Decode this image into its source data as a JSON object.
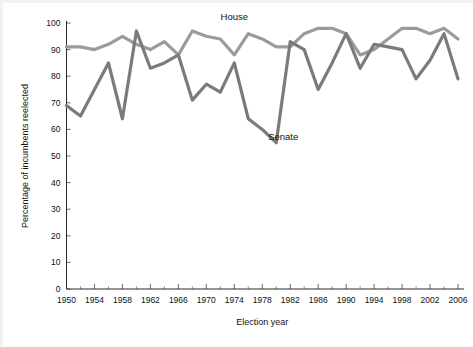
{
  "chart_data": {
    "type": "line",
    "title": "",
    "xlabel": "Election year",
    "ylabel": "Percentage of incumbents reelected",
    "xlim": [
      1950,
      2006
    ],
    "ylim": [
      0,
      100
    ],
    "grid": false,
    "legend_position": "inline-annotation",
    "x": [
      1950,
      1952,
      1954,
      1956,
      1958,
      1960,
      1962,
      1964,
      1966,
      1968,
      1970,
      1972,
      1974,
      1976,
      1978,
      1980,
      1982,
      1984,
      1986,
      1988,
      1990,
      1992,
      1994,
      1996,
      1998,
      2000,
      2002,
      2004,
      2006
    ],
    "xtick_labels": [
      "1950",
      "1954",
      "1958",
      "1962",
      "1966",
      "1970",
      "1974",
      "1978",
      "1982",
      "1986",
      "1990",
      "1994",
      "1998",
      "2002",
      "2006"
    ],
    "xtick_values": [
      1950,
      1954,
      1958,
      1962,
      1966,
      1970,
      1974,
      1978,
      1982,
      1986,
      1990,
      1994,
      1998,
      2002,
      2006
    ],
    "ytick_labels": [
      "0",
      "10",
      "20",
      "30",
      "40",
      "50",
      "60",
      "70",
      "80",
      "90",
      "100"
    ],
    "ytick_values": [
      0,
      10,
      20,
      30,
      40,
      50,
      60,
      70,
      80,
      90,
      100
    ],
    "series": [
      {
        "name": "House",
        "color": "#9b9b9b",
        "label_x": 1974,
        "label_y": 101,
        "values": [
          91,
          91,
          90,
          92,
          95,
          92,
          90,
          93,
          88,
          97,
          95,
          94,
          88,
          96,
          94,
          91,
          91,
          96,
          98,
          98,
          96,
          88,
          90,
          94,
          98,
          98,
          96,
          98,
          94
        ]
      },
      {
        "name": "Senate",
        "color": "#7b7b7b",
        "label_x": 1981,
        "label_y": 56,
        "values": [
          69,
          65,
          75,
          85,
          64,
          97,
          83,
          85,
          88,
          71,
          77,
          74,
          85,
          64,
          60,
          55,
          93,
          90,
          75,
          85,
          96,
          83,
          92,
          91,
          90,
          79,
          86,
          96,
          79
        ]
      }
    ],
    "annotations": [
      {
        "text": "House",
        "series": "House"
      },
      {
        "text": "Senate",
        "series": "Senate"
      }
    ]
  },
  "axes": {
    "x_title": "Election year",
    "y_title": "Percentage of incumbents reelected"
  }
}
